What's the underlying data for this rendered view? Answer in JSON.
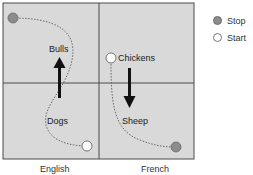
{
  "diagram": {
    "quadrant_labels": {
      "top_left": "Bulls",
      "bottom_left": "Dogs",
      "top_right": "Chickens",
      "bottom_right": "Sheep"
    },
    "column_labels": [
      "English",
      "French"
    ],
    "colors": {
      "background": "#d9d9d9",
      "stop_fill": "#8c8c8c",
      "start_fill": "#ffffff",
      "arrow": "#111111",
      "grid_line": "#4a4a4a"
    }
  },
  "legend": {
    "items": [
      {
        "label": "Stop",
        "symbol": "filled-circle"
      },
      {
        "label": "Start",
        "symbol": "open-circle"
      }
    ]
  }
}
